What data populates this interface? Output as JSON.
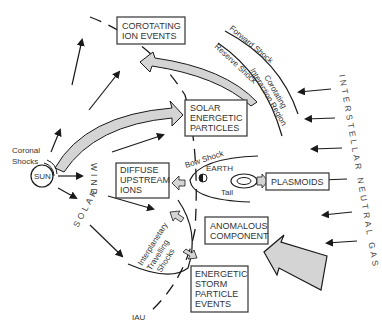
{
  "diagram": {
    "boxes": {
      "corotating": [
        "COROTATING",
        "ION EVENTS"
      ],
      "solar_energetic": [
        "SOLAR",
        "ENERGETIC",
        "PARTICLES"
      ],
      "diffuse": [
        "DIFFUSE",
        "UPSTREAM",
        "IONS"
      ],
      "plasmoids": [
        "PLASMOIDS"
      ],
      "anomalous": [
        "ANOMALOUS",
        "COMPONENT"
      ],
      "storm": [
        "ENERGETIC",
        "STORM",
        "PARTICLE",
        "EVENTS"
      ]
    },
    "labels": {
      "sun": "SUN",
      "coronal_shocks": [
        "Coronal",
        "Shocks"
      ],
      "solar_wind": "SOLAR WIND",
      "earth": "EARTH",
      "bow_shock": "Bow Shock",
      "tail": "Tail",
      "forward_shock": "Forward Shock",
      "reverse_shock": "Reserve Shock",
      "cir": [
        "Corotating",
        "Interaction Region"
      ],
      "interplanetary": [
        "Interplanetary",
        "Travelling",
        "Shocks"
      ],
      "iau": "IAU",
      "interstellar": "INTERSTELLAR NEUTRAL GAS"
    },
    "colors": {
      "line": "#1a1a1a",
      "arrow_fill": "#d4d4d4",
      "box_border": "#333333"
    }
  }
}
